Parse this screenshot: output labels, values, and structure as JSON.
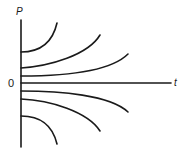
{
  "diagram": {
    "title": "",
    "axes": {
      "y_label": "P",
      "x_label": "t",
      "origin_label": "0"
    },
    "colors": {
      "stroke": "#1a1a1a",
      "background": "#ffffff"
    },
    "curves": [
      {
        "name": "upper-1",
        "start_P_px": 52,
        "direction": "up",
        "steepness": "steep"
      },
      {
        "name": "upper-2",
        "start_P_px": 68,
        "direction": "up",
        "steepness": "medium"
      },
      {
        "name": "upper-3",
        "start_P_px": 76,
        "direction": "up",
        "steepness": "gentle"
      },
      {
        "name": "lower-1",
        "start_P_px": 91,
        "direction": "down",
        "steepness": "gentle"
      },
      {
        "name": "lower-2",
        "start_P_px": 99,
        "direction": "down",
        "steepness": "medium"
      },
      {
        "name": "lower-3",
        "start_P_px": 116,
        "direction": "down",
        "steepness": "steep"
      }
    ]
  }
}
